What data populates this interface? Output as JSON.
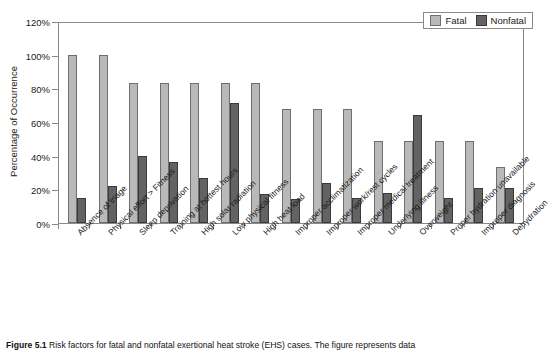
{
  "chart_data": {
    "type": "bar",
    "title": "",
    "xlabel": "",
    "ylabel": "Percentage of Occurrence",
    "ylim": [
      0,
      120
    ],
    "yticks": [
      "0%",
      "20%",
      "40%",
      "60%",
      "80%",
      "100%",
      "120%"
    ],
    "ytick_values": [
      0,
      20,
      40,
      60,
      80,
      100,
      120
    ],
    "grid": false,
    "legend_position": "top-right",
    "categories": [
      "Absence of triage",
      "Physical effort > Fitness",
      "Sleep deprivation",
      "Training at hottest hours",
      "High solar radiation",
      "Low physical fitness",
      "High heat load",
      "Improper acclimatization",
      "Improper work/rest cycles",
      "Improper medical treatment",
      "Underlying illness",
      "Overweight",
      "Proper hydration unavailable",
      "Improper diagnosis",
      "Dehydration"
    ],
    "series": [
      {
        "name": "Fatal",
        "color": "#b9b9b9",
        "values": [
          100,
          100,
          83,
          83,
          83,
          83,
          83,
          68,
          68,
          68,
          49,
          49,
          49,
          49,
          33
        ]
      },
      {
        "name": "Nonfatal",
        "color": "#636363",
        "values": [
          15,
          22,
          40,
          36,
          27,
          71,
          17,
          14,
          24,
          15,
          18,
          64,
          15,
          21,
          21
        ]
      }
    ]
  },
  "legend": {
    "items": [
      {
        "label": "Fatal"
      },
      {
        "label": "Nonfatal"
      }
    ]
  },
  "caption": {
    "label": "Figure 5.1",
    "text": "Risk factors for fatal and nonfatal exertional heat stroke (EHS) cases. The figure represents data"
  }
}
